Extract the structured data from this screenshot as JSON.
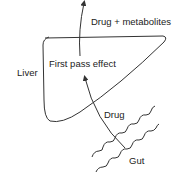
{
  "diagram": {
    "labels": {
      "drug_metabolites": "Drug + metabolites",
      "first_pass": "First pass effect",
      "liver": "Liver",
      "drug": "Drug",
      "gut": "Gut"
    },
    "colors": {
      "stroke": "#333333",
      "text": "#222222",
      "background": "#ffffff"
    }
  }
}
